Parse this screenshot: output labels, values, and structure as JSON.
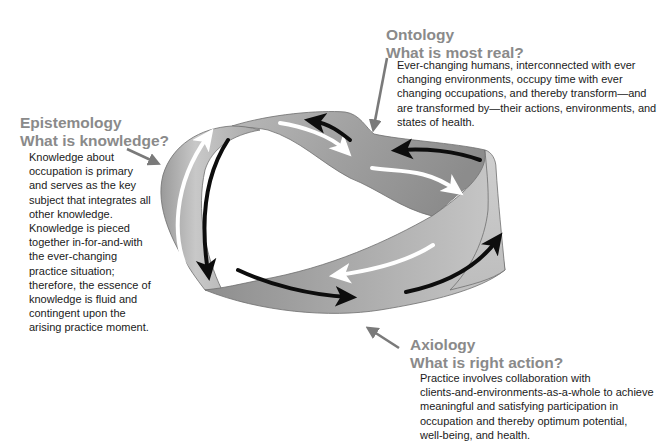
{
  "diagram": {
    "type": "mobius-strip",
    "sections": {
      "ontology": {
        "title": "Ontology",
        "question": "What is most real?",
        "lines": [
          "Ever-changing humans, interconnected with ever",
          "changing environments, occupy time with ever",
          "changing occupations, and thereby transform—and",
          "are transformed by—their actions, environments, and",
          "states of health."
        ]
      },
      "epistemology": {
        "title": "Epistemology",
        "question": "What is knowledge?",
        "lines": [
          "Knowledge about",
          "occupation is primary",
          "and serves as the key",
          "subject that integrates all",
          "other knowledge.",
          "Knowledge is pieced",
          "together in-for-and-with",
          "the ever-changing",
          "practice situation;",
          "therefore, the essence of",
          "knowledge is fluid and",
          "contingent upon the",
          "arising practice moment."
        ]
      },
      "axiology": {
        "title": "Axiology",
        "question": "What is right action?",
        "lines": [
          "Practice involves collaboration with",
          "clients-and-environments-as-a-whole to achieve",
          "meaningful and satisfying participation in",
          "occupation and thereby optimum potential,",
          "well-being, and health."
        ]
      }
    },
    "colors": {
      "heading": "#8a8a8a",
      "body_text": "#1a1a1a",
      "pointer_arrow": "#7a7a7a",
      "ribbon_light": "#c4c4c4",
      "ribbon_dark": "#8c8c8c",
      "flow_arrow_dark": "#0d0d0d",
      "flow_arrow_light": "#ffffff"
    }
  }
}
